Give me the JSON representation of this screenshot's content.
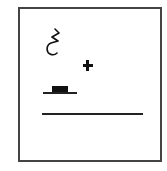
{
  "diagram": {
    "symbols": [
      {
        "name": "squiggle-hook",
        "kind": "contact/movement mark"
      },
      {
        "name": "plus",
        "glyph": "+"
      },
      {
        "name": "block-on-line",
        "kind": "handshape/location block"
      },
      {
        "name": "baseline",
        "kind": "horizontal line"
      }
    ],
    "colors": {
      "stroke": "#111111",
      "frame": "#444444",
      "background": "#ffffff"
    }
  }
}
